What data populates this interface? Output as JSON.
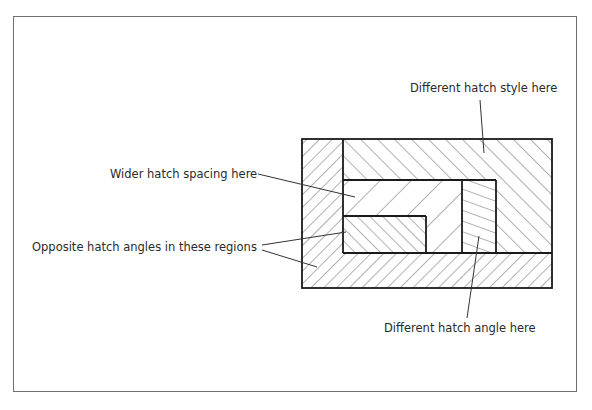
{
  "diagram": {
    "type": "hatch-pattern-illustration",
    "annotations": [
      {
        "id": "different-style",
        "text": "Different hatch style here"
      },
      {
        "id": "wider-spacing",
        "text": "Wider hatch spacing here"
      },
      {
        "id": "opposite-angles",
        "text": "Opposite hatch angles in these regions"
      },
      {
        "id": "different-angle",
        "text": "Different hatch angle here"
      }
    ],
    "regions": [
      {
        "id": "outer-left-bottom",
        "hatch": "45deg-forward",
        "spacing": 9
      },
      {
        "id": "top-right-L",
        "hatch": "45deg-back",
        "spacing": 12
      },
      {
        "id": "inner-wide",
        "hatch": "45deg-forward",
        "spacing": 22
      },
      {
        "id": "small-box",
        "hatch": "45deg-back",
        "spacing": 9
      },
      {
        "id": "vertical-strip",
        "hatch": "shallow-20deg",
        "spacing": 10
      }
    ],
    "colors": {
      "stroke": "#1a1a1a",
      "hatch": "#555555",
      "frame": "#6e6e6e",
      "text": "#2a2a2a"
    }
  }
}
